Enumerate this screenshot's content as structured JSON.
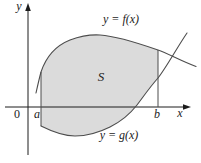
{
  "diagram": {
    "labels": {
      "y_axis": "y",
      "x_axis": "x",
      "origin": "0",
      "left_bound": "a",
      "right_bound": "b",
      "region": "S",
      "upper_curve": "y = f(x)",
      "lower_curve": "y = g(x)"
    },
    "colors": {
      "background": "#ffffff",
      "region_fill": "#dbdbdb",
      "curve_stroke": "#4d4d4d",
      "axis_stroke": "#1c1c1c",
      "text": "#1c1c1c"
    }
  }
}
